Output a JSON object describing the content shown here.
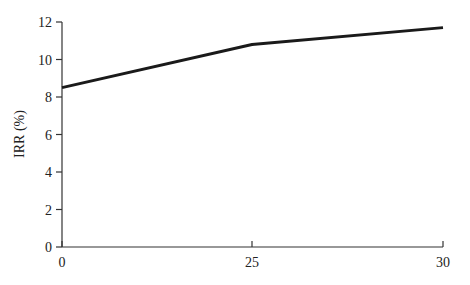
{
  "chart_data": {
    "type": "line",
    "title": "",
    "xlabel": "",
    "ylabel": "IRR (%)",
    "x": [
      0,
      25,
      30
    ],
    "series": [
      {
        "name": "IRR",
        "values": [
          8.5,
          10.8,
          11.7
        ],
        "color": "#1a1a1a"
      }
    ],
    "xticks": [
      0,
      25,
      30
    ],
    "yticks": [
      0,
      2,
      4,
      6,
      8,
      10,
      12
    ],
    "xlim": [
      0,
      30
    ],
    "ylim": [
      0,
      12
    ],
    "grid": false,
    "legend": null
  }
}
